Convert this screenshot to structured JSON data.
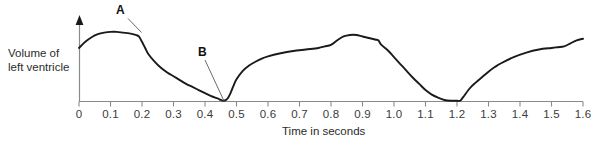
{
  "chart_data": {
    "type": "line",
    "title": "",
    "subtitle": "",
    "xlabel": "Time in seconds",
    "ylabel": "Volume of left ventricle",
    "ylabel_line1": "Volume of",
    "ylabel_line2": "left ventricle",
    "xlim": [
      0,
      1.6
    ],
    "ylim": [
      0,
      1
    ],
    "grid": false,
    "legend": null,
    "y_axis_ticks": false,
    "y_axis_arrow": true,
    "x_tick_labels": [
      "0",
      "0.1",
      "0.2",
      "0.3",
      "0.4",
      "0.5",
      "0.6",
      "0.7",
      "0.8",
      "0.9",
      "1.0",
      "1.1",
      "1.2",
      "1.3",
      "1.4",
      "1.5",
      "1.6"
    ],
    "x_tick_values": [
      0,
      0.1,
      0.2,
      0.3,
      0.4,
      0.5,
      0.6,
      0.7,
      0.8,
      0.9,
      1.0,
      1.1,
      1.2,
      1.3,
      1.4,
      1.5,
      1.6
    ],
    "annotations": [
      {
        "text": "A",
        "target_x": 0.19,
        "target_y": 0.83,
        "note": "end of plateau / start of rapid ejection"
      },
      {
        "text": "B",
        "target_x": 0.46,
        "target_y": 0.01,
        "note": "minimum left ventricular volume"
      }
    ],
    "series": [
      {
        "name": "Volume of left ventricle",
        "color": "#1a1a1a",
        "x": [
          0.0,
          0.02,
          0.04,
          0.06,
          0.08,
          0.1,
          0.12,
          0.14,
          0.16,
          0.18,
          0.19,
          0.2,
          0.21,
          0.22,
          0.24,
          0.26,
          0.28,
          0.3,
          0.32,
          0.34,
          0.36,
          0.38,
          0.4,
          0.42,
          0.44,
          0.45,
          0.46,
          0.47,
          0.48,
          0.49,
          0.5,
          0.52,
          0.54,
          0.56,
          0.58,
          0.6,
          0.64,
          0.68,
          0.72,
          0.76,
          0.78,
          0.8,
          0.82,
          0.84,
          0.86,
          0.88,
          0.9,
          0.92,
          0.94,
          0.95,
          0.96,
          0.98,
          1.0,
          1.02,
          1.04,
          1.06,
          1.08,
          1.1,
          1.12,
          1.14,
          1.16,
          1.18,
          1.2,
          1.21,
          1.22,
          1.24,
          1.26,
          1.28,
          1.3,
          1.32,
          1.34,
          1.38,
          1.42,
          1.46,
          1.5,
          1.52,
          1.54,
          1.56,
          1.58,
          1.6
        ],
        "y": [
          0.7,
          0.78,
          0.84,
          0.88,
          0.9,
          0.91,
          0.91,
          0.9,
          0.89,
          0.87,
          0.85,
          0.78,
          0.7,
          0.62,
          0.52,
          0.44,
          0.38,
          0.33,
          0.28,
          0.23,
          0.19,
          0.15,
          0.11,
          0.07,
          0.04,
          0.02,
          0.01,
          0.03,
          0.1,
          0.2,
          0.29,
          0.4,
          0.47,
          0.52,
          0.56,
          0.59,
          0.63,
          0.66,
          0.68,
          0.7,
          0.72,
          0.74,
          0.8,
          0.85,
          0.87,
          0.87,
          0.85,
          0.83,
          0.81,
          0.8,
          0.74,
          0.67,
          0.58,
          0.49,
          0.4,
          0.31,
          0.23,
          0.15,
          0.09,
          0.05,
          0.02,
          0.01,
          0.01,
          0.01,
          0.06,
          0.17,
          0.25,
          0.32,
          0.39,
          0.45,
          0.5,
          0.58,
          0.64,
          0.68,
          0.7,
          0.71,
          0.72,
          0.76,
          0.8,
          0.82
        ]
      }
    ]
  },
  "figure": {
    "y_axis_title_line1": "Volume of",
    "y_axis_title_line2": "left ventricle",
    "x_axis_title": "Time in seconds",
    "label_a": "A",
    "label_b": "B",
    "curve_color": "#1a1a1a",
    "axis_color": "#8a8a8a",
    "text_color": "#2b2b2b"
  }
}
